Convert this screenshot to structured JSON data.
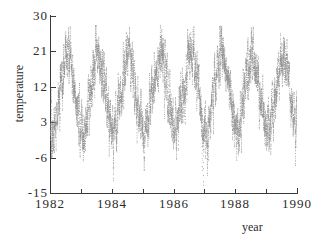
{
  "chart_data": {
    "type": "line",
    "title": "",
    "xlabel": "year",
    "ylabel": "temperature",
    "xlim": [
      1982,
      1990
    ],
    "ylim": [
      -15,
      30
    ],
    "grid": false,
    "legend": null,
    "series_color": "#8a8a8a",
    "axis_color": "#3a3a3a",
    "x_ticks": [
      1982,
      1983,
      1984,
      1985,
      1986,
      1987,
      1988,
      1989,
      1990
    ],
    "x_tick_labels": [
      "1982",
      "",
      "1984",
      "",
      "1986",
      "",
      "1988",
      "",
      "1990"
    ],
    "y_ticks": [
      -15,
      -6,
      3,
      12,
      21,
      30
    ],
    "y_tick_labels": [
      "-15",
      "-6",
      "3",
      "12",
      "21",
      "30"
    ],
    "sampling": "daily",
    "seasonal_model": {
      "mean": 10.5,
      "amplitude": 9.5,
      "peak_day_of_year": 200,
      "noise_sd": 3.4,
      "typical_summer_max": 26,
      "typical_winter_min": -12
    },
    "annual_peaks": [
      24,
      26,
      24,
      24,
      25,
      24,
      23,
      26
    ],
    "annual_troughs": [
      -7,
      -4,
      -3,
      -12,
      -8,
      -13,
      -6,
      -5
    ],
    "n_points": 2922
  },
  "axis": {
    "y_label": "temperature",
    "x_label": "year"
  }
}
